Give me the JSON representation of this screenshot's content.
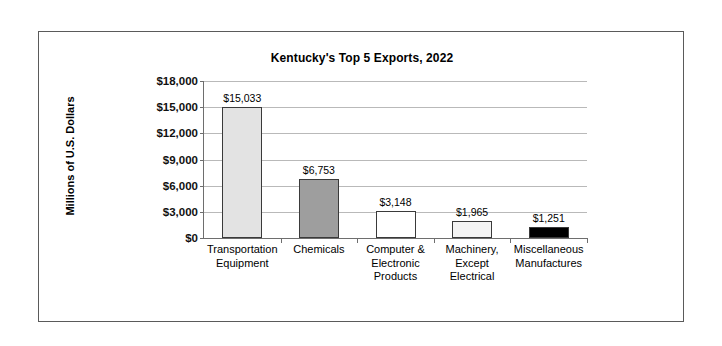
{
  "figure": {
    "border_color": "#5a5a5a",
    "background": "#ffffff"
  },
  "chart_data": {
    "type": "bar",
    "title": "Kentucky's Top 5 Exports, 2022",
    "xlabel": "",
    "ylabel": "Millions of U.S. Dollars",
    "ylim": [
      0,
      18000
    ],
    "ytick_step": 3000,
    "grid": true,
    "legend": "none",
    "categories": [
      "Transportation Equipment",
      "Chemicals",
      "Computer & Electronic Products",
      "Machinery, Except Electrical",
      "Miscellaneous Manufactures"
    ],
    "category_lines": [
      [
        "Transportation",
        "Equipment"
      ],
      [
        "Chemicals"
      ],
      [
        "Computer &",
        "Electronic",
        "Products"
      ],
      [
        "Machinery,",
        "Except",
        "Electrical"
      ],
      [
        "Miscellaneous",
        "Manufactures"
      ]
    ],
    "values": [
      15033,
      6753,
      3148,
      1965,
      1251
    ],
    "value_labels": [
      "$15,033",
      "$6,753",
      "$3,148",
      "$1,965",
      "$1,251"
    ],
    "bar_colors": [
      "#e3e3e3",
      "#9e9e9e",
      "#ffffff",
      "#f4f4f4",
      "#000000"
    ],
    "bar_edge_color": "#3a3a3a",
    "ytick_labels": [
      "$18,000",
      "$15,000",
      "$12,000",
      "$9,000",
      "$6,000",
      "$3,000",
      "$0"
    ],
    "ytick_values": [
      18000,
      15000,
      12000,
      9000,
      6000,
      3000,
      0
    ],
    "gridline_color": "#b9b9b9",
    "axis_color": "#6e6e6e"
  }
}
